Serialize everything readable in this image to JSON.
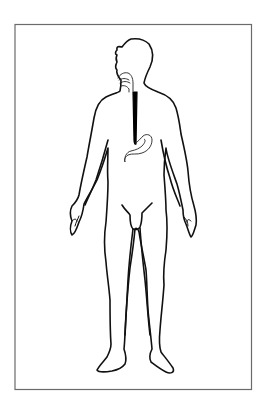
{
  "figure": {
    "highlighted_organs": [
      "mouth",
      "esophagus",
      "stomach"
    ],
    "colors": {
      "background": "#ffffff",
      "frame": "#6b6b6b",
      "outline": "#111111",
      "esophagus": "#000000"
    }
  }
}
